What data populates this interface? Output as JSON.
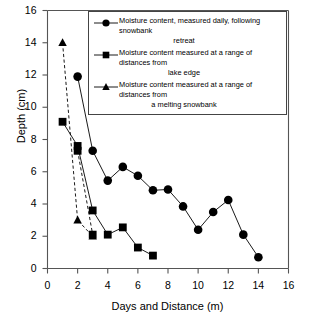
{
  "chart_data": {
    "type": "line",
    "title": "",
    "xlabel": "Days and Distance (m)",
    "ylabel": "Depth (cm)",
    "xlim": [
      0,
      16
    ],
    "ylim": [
      0,
      16
    ],
    "xticks": [
      0,
      2,
      4,
      6,
      8,
      10,
      12,
      14,
      16
    ],
    "yticks": [
      0,
      2,
      4,
      6,
      8,
      10,
      12,
      14,
      16
    ],
    "grid": false,
    "legend_position": "top-right",
    "series": [
      {
        "name": "Moisture content, measured daily, following snowbank retreat",
        "marker": "circle",
        "linestyle": "solid",
        "color": "#000000",
        "x": [
          2,
          3,
          4,
          5,
          6,
          7,
          8,
          9,
          10,
          11,
          12,
          13,
          14
        ],
        "y": [
          11.9,
          7.3,
          5.45,
          6.3,
          5.75,
          4.85,
          4.9,
          3.85,
          2.4,
          3.5,
          4.25,
          2.1,
          0.7
        ]
      },
      {
        "name": "Moisture content measured at a range of distances from lake edge",
        "marker": "square",
        "linestyle": "solid",
        "color": "#000000",
        "x": [
          1,
          2,
          3,
          4,
          5,
          6,
          7
        ],
        "y": [
          9.1,
          7.6,
          3.6,
          2.1,
          2.55,
          1.3,
          0.8
        ]
      },
      {
        "name": "Moisture content measured at a range of distances from a melting snowbank",
        "marker": "triangle",
        "linestyle": "dashed",
        "color": "#000000",
        "x": [
          1,
          2,
          3
        ],
        "y": [
          14,
          3,
          2
        ]
      },
      {
        "name": "lake-edge-upper-branch",
        "marker": "square",
        "linestyle": "dashed",
        "color": "#000000",
        "hidden_from_legend": true,
        "x": [
          2,
          3
        ],
        "y": [
          7.3,
          2.1
        ]
      }
    ]
  },
  "legend": {
    "entries": [
      {
        "marker": "circle",
        "line1": "Moisture content, measured daily, following snowbank",
        "line2": "retreat"
      },
      {
        "marker": "square",
        "line1": "Moisture content measured at a range of distances from",
        "line2": "lake edge"
      },
      {
        "marker": "triangle",
        "line1": "Moisture content measured at a range of distances from",
        "line2": "a melting snowbank"
      }
    ]
  },
  "axis_tick_labels": {
    "y": [
      "0",
      "2",
      "4",
      "6",
      "8",
      "10",
      "12",
      "14",
      "16"
    ],
    "x": [
      "0",
      "2",
      "4",
      "6",
      "8",
      "10",
      "12",
      "14",
      "16"
    ]
  }
}
